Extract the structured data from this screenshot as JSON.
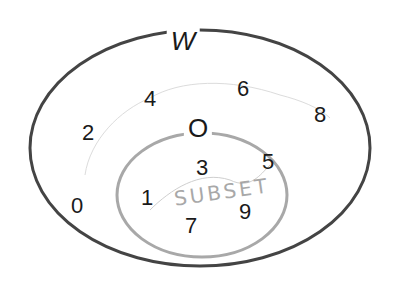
{
  "diagram": {
    "type": "venn",
    "sets": [
      {
        "name": "W",
        "elements": [
          0,
          1,
          2,
          3,
          4,
          5,
          6,
          7,
          8,
          9
        ],
        "stroke": "#444444"
      },
      {
        "name": "O",
        "elements": [
          1,
          3,
          5,
          7,
          9
        ],
        "stroke": "#a8a8a8"
      }
    ],
    "outer_label": "W",
    "inner_label": "O",
    "outer_only": [
      {
        "value": "2",
        "x": 88,
        "y": 133
      },
      {
        "value": "4",
        "x": 150,
        "y": 99
      },
      {
        "value": "6",
        "x": 243,
        "y": 89
      },
      {
        "value": "8",
        "x": 320,
        "y": 115
      },
      {
        "value": "0",
        "x": 77,
        "y": 206
      }
    ],
    "inner": [
      {
        "value": "3",
        "x": 202,
        "y": 168
      },
      {
        "value": "5",
        "x": 268,
        "y": 162
      },
      {
        "value": "1",
        "x": 147,
        "y": 198
      },
      {
        "value": "7",
        "x": 191,
        "y": 226
      },
      {
        "value": "9",
        "x": 245,
        "y": 212
      }
    ],
    "handwritten_annotation": "SUBSET"
  }
}
